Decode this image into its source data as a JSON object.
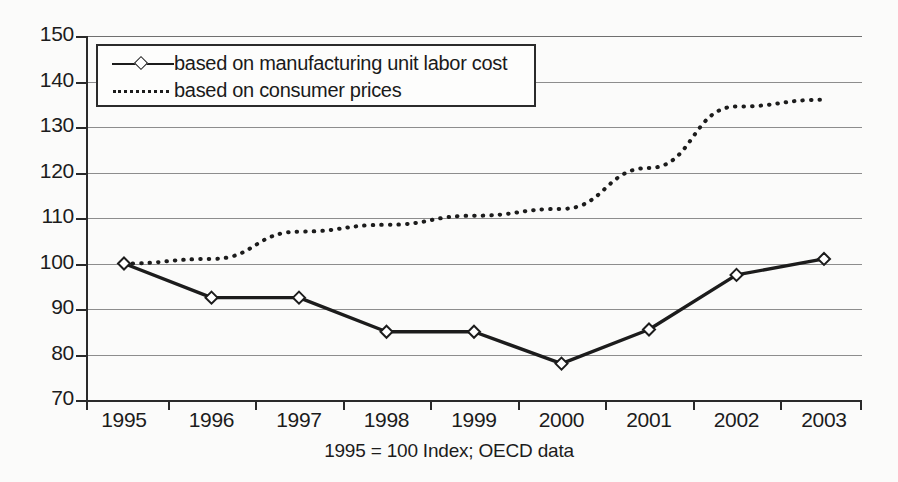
{
  "chart_data": {
    "type": "line",
    "title": "",
    "xlabel": "1995 = 100 Index; OECD data",
    "ylabel": "",
    "categories": [
      "1995",
      "1996",
      "1997",
      "1998",
      "1999",
      "2000",
      "2001",
      "2002",
      "2003"
    ],
    "ylim": [
      70,
      150
    ],
    "yticks": [
      70,
      80,
      90,
      100,
      110,
      120,
      130,
      140,
      150
    ],
    "grid": true,
    "legend_position": "top-left-inside",
    "series": [
      {
        "name": "based on manufacturing unit labor cost",
        "style": "solid",
        "marker": "open-diamond",
        "color": "#1c1c1c",
        "values": [
          100,
          92.5,
          92.5,
          85,
          85,
          78,
          85.5,
          97.5,
          101
        ]
      },
      {
        "name": "based on consumer prices",
        "style": "dotted",
        "marker": "none",
        "color": "#1c1c1c",
        "values": [
          100,
          101,
          107,
          108.5,
          110.5,
          112,
          121,
          134.5,
          136
        ]
      }
    ]
  },
  "axis": {
    "y_tick_labels": [
      "150",
      "140",
      "130",
      "120",
      "110",
      "100",
      "90",
      "80",
      "70"
    ],
    "x_tick_labels": [
      "1995",
      "1996",
      "1997",
      "1998",
      "1999",
      "2000",
      "2001",
      "2002",
      "2003"
    ]
  },
  "caption": {
    "text": "1995 = 100 Index; OECD data"
  },
  "legend": {
    "items": [
      {
        "label": "based on manufacturing unit labor cost",
        "key": "solid-diamond-line-icon"
      },
      {
        "label": "based on consumer prices",
        "key": "dotted-line-icon"
      }
    ]
  }
}
